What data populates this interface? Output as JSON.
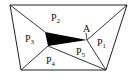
{
  "diagram": {
    "type": "geometry-partition",
    "stroke_color": "#222222",
    "fill_color": "#000000",
    "outer_shape": "trapezoid",
    "point_label": "A",
    "regions": [
      {
        "id": "P1",
        "main": "P",
        "sub": "1"
      },
      {
        "id": "P2",
        "main": "P",
        "sub": "2"
      },
      {
        "id": "P3",
        "main": "P",
        "sub": "3"
      },
      {
        "id": "P4",
        "main": "P",
        "sub": "4"
      },
      {
        "id": "P5",
        "main": "P",
        "sub": "5"
      }
    ]
  }
}
